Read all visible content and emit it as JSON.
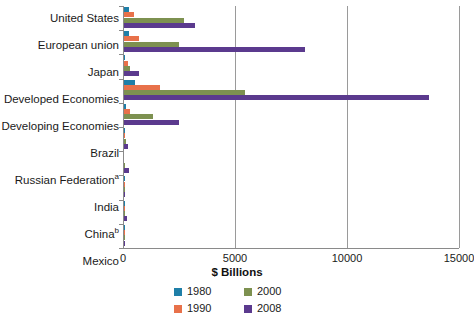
{
  "chart_data": {
    "type": "bar",
    "orientation": "horizontal",
    "title": "",
    "xlabel": "$ Billions",
    "ylabel": "",
    "xlim": [
      0,
      15000
    ],
    "xticks": [
      0,
      5000,
      10000,
      15000
    ],
    "xtick_labels": [
      "0",
      "5000",
      "10000",
      "15000"
    ],
    "grid": true,
    "legend_position": "bottom",
    "categories": [
      "United States",
      "European union",
      "Japan",
      "Developed Economies",
      "Developing Economies",
      "Brazil",
      "Russian Federation",
      "India",
      "China",
      "Mexico"
    ],
    "category_footnotes": {
      "Russian Federation": "a",
      "China": "b"
    },
    "series": [
      {
        "name": "1980",
        "color": "#1f7fa8",
        "values": [
          220,
          215,
          20,
          500,
          110,
          17,
          0,
          2,
          6,
          2
        ]
      },
      {
        "name": "1990",
        "color": "#e8714a",
        "values": [
          430,
          690,
          200,
          1600,
          250,
          37,
          0,
          2,
          25,
          4
        ]
      },
      {
        "name": "2000",
        "color": "#7d9150",
        "values": [
          2700,
          2450,
          280,
          5400,
          1300,
          100,
          20,
          16,
          28,
          22
        ]
      },
      {
        "name": "2008",
        "color": "#5b3a8e",
        "values": [
          3160,
          8100,
          680,
          13600,
          2450,
          162,
          213,
          61,
          148,
          28
        ]
      }
    ]
  },
  "legend": {
    "items": [
      {
        "label": "1980",
        "color": "#1f7fa8"
      },
      {
        "label": "2000",
        "color": "#7d9150"
      },
      {
        "label": "1990",
        "color": "#e8714a"
      },
      {
        "label": "2008",
        "color": "#5b3a8e"
      }
    ]
  },
  "axis": {
    "x_title": "$ Billions"
  }
}
